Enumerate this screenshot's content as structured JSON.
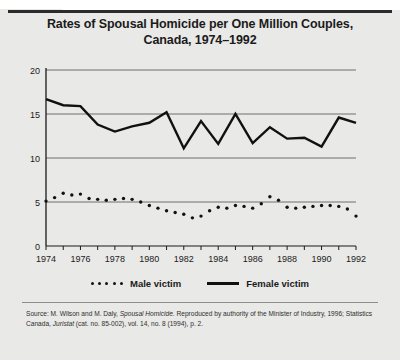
{
  "figure": {
    "number_label": "FIGURE 4.1",
    "title_line1": "Rates of Spousal Homicide per One Million Couples,",
    "title_line2": "Canada, 1974–1992"
  },
  "legend": {
    "male_label": "Male victim",
    "female_label": "Female victim",
    "male_marker": "dotted-line-swatch",
    "female_marker": "solid-line-swatch"
  },
  "source": {
    "line1_plain_a": "Source: M. Wilson and M. Daly, ",
    "line1_italic_a": "Spousal Homicide",
    "line1_plain_b": ". Reproduced by authority of the Minister of Industry, 1996;",
    "line2_plain_a": "Statistics Canada, ",
    "line2_italic_a": "Juristat",
    "line2_plain_b": " (cat. no. 85-002), vol. 14, no. 8 (1994), p. 2."
  },
  "colors": {
    "background": "#e9e9e7",
    "plot_background": "#e9e9e7",
    "line": "#111111",
    "gridline": "#6f6f6d",
    "axis": "#1b1b1b",
    "text": "#1b1b1b"
  },
  "chart_data": {
    "type": "line",
    "title": "Rates of Spousal Homicide per One Million Couples, Canada, 1974–1992",
    "xlabel": "",
    "ylabel": "",
    "xlim": [
      1974,
      1992
    ],
    "ylim": [
      0,
      20
    ],
    "yticks": [
      0,
      5,
      10,
      15,
      20
    ],
    "ytick_labels": [
      "0",
      "5",
      "10",
      "15",
      "20"
    ],
    "xticks": [
      1974,
      1975,
      1976,
      1977,
      1978,
      1979,
      1980,
      1981,
      1982,
      1983,
      1984,
      1985,
      1986,
      1987,
      1988,
      1989,
      1990,
      1991,
      1992
    ],
    "xtick_labels": [
      "1974",
      "",
      "1976",
      "",
      "1978",
      "",
      "1980",
      "",
      "1982",
      "",
      "1984",
      "",
      "1986",
      "",
      "1988",
      "",
      "1990",
      "",
      "1992"
    ],
    "grid": true,
    "grid_axis": "y",
    "legend_position": "below",
    "series": [
      {
        "name": "Female victim",
        "style": "solid",
        "x": [
          1974,
          1975,
          1976,
          1977,
          1978,
          1979,
          1980,
          1981,
          1982,
          1983,
          1984,
          1985,
          1986,
          1987,
          1988,
          1989,
          1990,
          1991,
          1992
        ],
        "values": [
          16.7,
          16.0,
          15.9,
          13.8,
          13.0,
          13.6,
          14.0,
          15.2,
          11.1,
          14.2,
          11.6,
          15.0,
          11.7,
          13.5,
          12.2,
          12.3,
          11.3,
          14.6,
          14.0
        ]
      },
      {
        "name": "Male victim",
        "style": "dotted",
        "x": [
          1974.0,
          1974.5,
          1975.0,
          1975.5,
          1976.0,
          1976.5,
          1977.0,
          1977.5,
          1978.0,
          1978.5,
          1979.0,
          1979.5,
          1980.0,
          1980.5,
          1981.0,
          1981.5,
          1982.0,
          1982.5,
          1983.0,
          1983.5,
          1984.0,
          1984.5,
          1985.0,
          1985.5,
          1986.0,
          1986.5,
          1987.0,
          1987.5,
          1988.0,
          1988.5,
          1989.0,
          1989.5,
          1990.0,
          1990.5,
          1991.0,
          1991.5,
          1992.0
        ],
        "values": [
          5.1,
          5.5,
          6.0,
          5.8,
          5.9,
          5.4,
          5.3,
          5.2,
          5.3,
          5.4,
          5.3,
          5.0,
          4.6,
          4.3,
          4.0,
          3.8,
          3.6,
          3.2,
          3.4,
          4.0,
          4.4,
          4.3,
          4.6,
          4.5,
          4.3,
          4.8,
          5.6,
          5.2,
          4.4,
          4.3,
          4.4,
          4.5,
          4.6,
          4.6,
          4.5,
          4.2,
          3.4
        ]
      }
    ]
  }
}
